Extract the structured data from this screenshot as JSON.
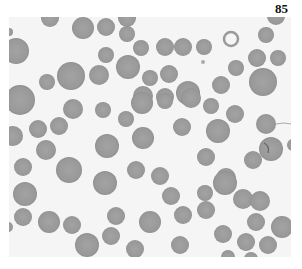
{
  "page": {
    "number": "85"
  },
  "figure": {
    "type": "blood-smear-micrograph",
    "background_color": "#f5f5f5",
    "cell_color": "#9b9b9b",
    "cell_edge_color": "#8e8e8e",
    "cells": [
      {
        "cx": 50,
        "cy": 18,
        "r": 9
      },
      {
        "cx": 83,
        "cy": 28,
        "r": 11
      },
      {
        "cx": 9,
        "cy": 32,
        "r": 4
      },
      {
        "cx": 16,
        "cy": 51,
        "r": 13
      },
      {
        "cx": 71,
        "cy": 76,
        "r": 14
      },
      {
        "cx": 47,
        "cy": 82,
        "r": 8
      },
      {
        "cx": 20,
        "cy": 100,
        "r": 15
      },
      {
        "cx": 106,
        "cy": 27,
        "r": 9
      },
      {
        "cx": 127,
        "cy": 18,
        "r": 9
      },
      {
        "cx": 127,
        "cy": 34,
        "r": 8
      },
      {
        "cx": 141,
        "cy": 48,
        "r": 8
      },
      {
        "cx": 165,
        "cy": 47,
        "r": 9
      },
      {
        "cx": 183,
        "cy": 47,
        "r": 9
      },
      {
        "cx": 106,
        "cy": 55,
        "r": 8
      },
      {
        "cx": 128,
        "cy": 67,
        "r": 12
      },
      {
        "cx": 99,
        "cy": 75,
        "r": 10
      },
      {
        "cx": 150,
        "cy": 78,
        "r": 8
      },
      {
        "cx": 169,
        "cy": 74,
        "r": 9
      },
      {
        "cx": 143,
        "cy": 96,
        "r": 10
      },
      {
        "cx": 165,
        "cy": 97,
        "r": 9
      },
      {
        "cx": 188,
        "cy": 93,
        "r": 12
      },
      {
        "cx": 276,
        "cy": 16,
        "r": 9
      },
      {
        "cx": 266,
        "cy": 35,
        "r": 8
      },
      {
        "cx": 204,
        "cy": 47,
        "r": 8
      },
      {
        "cx": 257,
        "cy": 58,
        "r": 9
      },
      {
        "cx": 278,
        "cy": 58,
        "r": 8
      },
      {
        "cx": 236,
        "cy": 68,
        "r": 8
      },
      {
        "cx": 263,
        "cy": 82,
        "r": 14
      },
      {
        "cx": 221,
        "cy": 85,
        "r": 9
      },
      {
        "cx": 73,
        "cy": 109,
        "r": 10
      },
      {
        "cx": 38,
        "cy": 129,
        "r": 9
      },
      {
        "cx": 59,
        "cy": 126,
        "r": 9
      },
      {
        "cx": 13,
        "cy": 136,
        "r": 10
      },
      {
        "cx": 46,
        "cy": 150,
        "r": 10
      },
      {
        "cx": 23,
        "cy": 167,
        "r": 9
      },
      {
        "cx": 69,
        "cy": 170,
        "r": 13
      },
      {
        "cx": 103,
        "cy": 110,
        "r": 8
      },
      {
        "cx": 142,
        "cy": 103,
        "r": 11
      },
      {
        "cx": 165,
        "cy": 101,
        "r": 8
      },
      {
        "cx": 191,
        "cy": 98,
        "r": 10
      },
      {
        "cx": 126,
        "cy": 119,
        "r": 8
      },
      {
        "cx": 143,
        "cy": 138,
        "r": 11
      },
      {
        "cx": 182,
        "cy": 127,
        "r": 9
      },
      {
        "cx": 107,
        "cy": 146,
        "r": 12
      },
      {
        "cx": 136,
        "cy": 170,
        "r": 9
      },
      {
        "cx": 160,
        "cy": 176,
        "r": 9
      },
      {
        "cx": 211,
        "cy": 106,
        "r": 8
      },
      {
        "cx": 235,
        "cy": 114,
        "r": 9
      },
      {
        "cx": 218,
        "cy": 131,
        "r": 12
      },
      {
        "cx": 266,
        "cy": 124,
        "r": 10
      },
      {
        "cx": 271,
        "cy": 149,
        "r": 12
      },
      {
        "cx": 206,
        "cy": 157,
        "r": 9
      },
      {
        "cx": 253,
        "cy": 160,
        "r": 9
      },
      {
        "cx": 226,
        "cy": 178,
        "r": 10
      },
      {
        "cx": 25,
        "cy": 194,
        "r": 12
      },
      {
        "cx": 23,
        "cy": 217,
        "r": 9
      },
      {
        "cx": 49,
        "cy": 222,
        "r": 11
      },
      {
        "cx": 72,
        "cy": 225,
        "r": 9
      },
      {
        "cx": 87,
        "cy": 245,
        "r": 12
      },
      {
        "cx": 8,
        "cy": 227,
        "r": 5
      },
      {
        "cx": 105,
        "cy": 183,
        "r": 12
      },
      {
        "cx": 116,
        "cy": 216,
        "r": 9
      },
      {
        "cx": 150,
        "cy": 222,
        "r": 11
      },
      {
        "cx": 111,
        "cy": 236,
        "r": 9
      },
      {
        "cx": 171,
        "cy": 196,
        "r": 9
      },
      {
        "cx": 183,
        "cy": 215,
        "r": 9
      },
      {
        "cx": 135,
        "cy": 249,
        "r": 9
      },
      {
        "cx": 180,
        "cy": 245,
        "r": 9
      },
      {
        "cx": 225,
        "cy": 183,
        "r": 12
      },
      {
        "cx": 205,
        "cy": 193,
        "r": 8
      },
      {
        "cx": 243,
        "cy": 199,
        "r": 10
      },
      {
        "cx": 260,
        "cy": 201,
        "r": 10
      },
      {
        "cx": 206,
        "cy": 210,
        "r": 9
      },
      {
        "cx": 256,
        "cy": 222,
        "r": 9
      },
      {
        "cx": 282,
        "cy": 227,
        "r": 11
      },
      {
        "cx": 223,
        "cy": 234,
        "r": 9
      },
      {
        "cx": 246,
        "cy": 242,
        "r": 9
      },
      {
        "cx": 268,
        "cy": 245,
        "r": 9
      },
      {
        "cx": 228,
        "cy": 257,
        "r": 7
      },
      {
        "cx": 251,
        "cy": 259,
        "r": 7
      },
      {
        "cx": 293,
        "cy": 145,
        "r": 6
      }
    ],
    "ghost_cell": {
      "cx": 231,
      "cy": 39,
      "r": 7
    },
    "debris_dot": {
      "cx": 203,
      "cy": 62,
      "r": 2
    }
  }
}
